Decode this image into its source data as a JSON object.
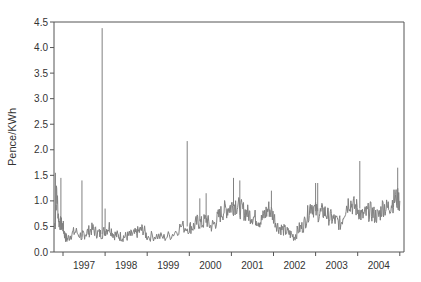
{
  "chart_data": {
    "type": "line",
    "title": "",
    "xlabel": "",
    "ylabel": "Pence/KWh",
    "ylim": [
      0.0,
      4.5
    ],
    "yticks": [
      "0.0",
      "0.5",
      "1.0",
      "1.5",
      "2.0",
      "2.5",
      "3.0",
      "3.5",
      "4.0",
      "4.5"
    ],
    "xtick_labels": [
      "1997",
      "1998",
      "1999",
      "2000",
      "2001",
      "2002",
      "2003",
      "2004"
    ],
    "xlim": [
      1996.8,
      2005.05
    ],
    "grid": false,
    "legend": null,
    "line_color": "#808080",
    "series": [
      {
        "name": "Electricity price",
        "x": [
          1996.8,
          1996.85,
          1996.9,
          1996.95,
          1997.0,
          1997.05,
          1997.1,
          1997.2,
          1997.3,
          1997.45,
          1997.5,
          1997.6,
          1997.7,
          1997.8,
          1997.9,
          1998.0,
          1998.1,
          1998.2,
          1998.3,
          1998.4,
          1998.5,
          1998.6,
          1998.7,
          1998.8,
          1998.9,
          1999.0,
          1999.2,
          1999.4,
          1999.6,
          1999.8,
          2000.0,
          2000.1,
          2000.2,
          2000.3,
          2000.4,
          2000.5,
          2000.6,
          2000.7,
          2000.8,
          2000.9,
          2001.0,
          2001.1,
          2001.2,
          2001.3,
          2001.4,
          2001.5,
          2001.6,
          2001.7,
          2001.8,
          2001.9,
          2002.0,
          2002.1,
          2002.2,
          2002.3,
          2002.4,
          2002.5,
          2002.6,
          2002.7,
          2002.8,
          2002.9,
          2003.0,
          2003.1,
          2003.2,
          2003.3,
          2003.4,
          2003.5,
          2003.6,
          2003.7,
          2003.8,
          2003.9,
          2004.0,
          2004.1,
          2004.2,
          2004.3,
          2004.4,
          2004.5,
          2004.6,
          2004.7,
          2004.8,
          2004.9,
          2005.0
        ],
        "values": [
          0.45,
          1.2,
          0.6,
          0.55,
          0.5,
          0.3,
          0.25,
          0.35,
          0.4,
          0.3,
          0.35,
          0.4,
          0.45,
          0.38,
          0.35,
          0.42,
          0.5,
          0.35,
          0.32,
          0.3,
          0.3,
          0.33,
          0.35,
          0.4,
          0.45,
          0.3,
          0.32,
          0.28,
          0.35,
          0.5,
          0.48,
          0.5,
          0.6,
          0.55,
          0.65,
          0.5,
          0.55,
          0.7,
          0.8,
          0.85,
          0.9,
          0.95,
          0.85,
          0.8,
          0.75,
          0.7,
          0.65,
          0.6,
          0.75,
          0.85,
          0.7,
          0.5,
          0.45,
          0.4,
          0.35,
          0.3,
          0.45,
          0.5,
          0.7,
          0.95,
          0.8,
          0.75,
          0.8,
          0.7,
          0.65,
          0.6,
          0.55,
          0.85,
          1.0,
          0.9,
          0.85,
          0.7,
          0.75,
          0.8,
          0.72,
          0.7,
          0.9,
          0.85,
          0.95,
          1.05,
          1.0
        ],
        "spikes": [
          {
            "x": 1996.82,
            "value": 1.55
          },
          {
            "x": 1996.95,
            "value": 1.45
          },
          {
            "x": 1997.45,
            "value": 1.4
          },
          {
            "x": 1997.93,
            "value": 4.38
          },
          {
            "x": 1998.0,
            "value": 0.85
          },
          {
            "x": 1999.95,
            "value": 2.17
          },
          {
            "x": 2000.25,
            "value": 1.05
          },
          {
            "x": 2000.4,
            "value": 1.15
          },
          {
            "x": 2001.05,
            "value": 1.45
          },
          {
            "x": 2001.2,
            "value": 1.4
          },
          {
            "x": 2001.95,
            "value": 1.2
          },
          {
            "x": 2003.0,
            "value": 1.35
          },
          {
            "x": 2003.05,
            "value": 1.35
          },
          {
            "x": 2004.05,
            "value": 1.78
          },
          {
            "x": 2004.95,
            "value": 1.65
          }
        ]
      }
    ]
  }
}
